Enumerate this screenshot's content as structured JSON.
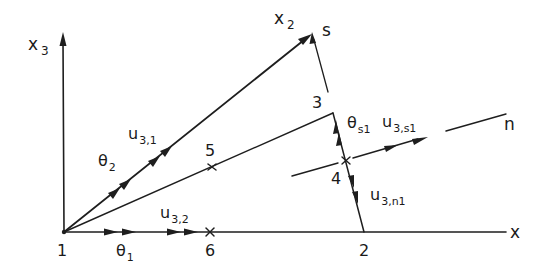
{
  "diagram": {
    "axes": {
      "x": "x",
      "x2": "x",
      "x2_sub": "2",
      "x3": "x",
      "x3_sub": "3",
      "s": "s",
      "n": "n"
    },
    "nodes": {
      "n1": "1",
      "n2": "2",
      "n3": "3",
      "n4": "4",
      "n5": "5",
      "n6": "6"
    },
    "labels": {
      "u31_main": "u",
      "u31_sub": "3,1",
      "theta2_main": "θ",
      "theta2_sub": "2",
      "u32_main": "u",
      "u32_sub": "3,2",
      "theta1_main": "θ",
      "theta1_sub": "1",
      "thetas1_main": "θ",
      "thetas1_sub": "s1",
      "u3s1_main": "u",
      "u3s1_sub": "3,s1",
      "u3n1_main": "u",
      "u3n1_sub": "3,n1"
    }
  }
}
